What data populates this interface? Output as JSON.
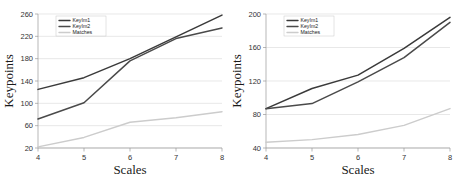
{
  "figure": {
    "panel_count": 2,
    "background": "#ffffff"
  },
  "colors": {
    "keyim1": "#3a3a3a",
    "keyim2": "#4a4a4a",
    "matches": "#cccccc",
    "grid": "#d9d9d9",
    "axis": "#9a9a9a",
    "text": "#1a1a1a"
  },
  "chart_data": [
    {
      "type": "line",
      "panel": "left",
      "title": "",
      "xlabel": "Scales",
      "ylabel": "Keypoints",
      "x": [
        4,
        5,
        6,
        7,
        8
      ],
      "xticklabels": [
        "4",
        "5",
        "6",
        "7",
        "8"
      ],
      "xlim": [
        4,
        8
      ],
      "ylim": [
        20,
        260
      ],
      "yticks": [
        20,
        60,
        100,
        140,
        180,
        220,
        260
      ],
      "yticklabels": [
        "20",
        "60",
        "100",
        "140",
        "180",
        "220",
        "260"
      ],
      "grid": true,
      "legend_position": "upper left",
      "series": [
        {
          "name": "KeyIm1",
          "values": [
            125,
            146,
            180,
            219,
            258
          ],
          "color": "#3a3a3a"
        },
        {
          "name": "KeyIm2",
          "values": [
            72,
            101,
            176,
            216,
            235
          ],
          "color": "#4a4a4a"
        },
        {
          "name": "Matches",
          "values": [
            22,
            39,
            66,
            74,
            85
          ],
          "color": "#cccccc"
        }
      ]
    },
    {
      "type": "line",
      "panel": "right",
      "title": "",
      "xlabel": "Scales",
      "ylabel": "Keypoints",
      "x": [
        4,
        5,
        6,
        7,
        8
      ],
      "xticklabels": [
        "4",
        "5",
        "6",
        "7",
        "8"
      ],
      "xlim": [
        4,
        8
      ],
      "ylim": [
        40,
        200
      ],
      "yticks": [
        40,
        80,
        120,
        160,
        200
      ],
      "yticklabels": [
        "40",
        "80",
        "120",
        "160",
        "200"
      ],
      "grid": true,
      "legend_position": "upper left",
      "series": [
        {
          "name": "KeyIm1",
          "values": [
            87,
            111,
            127,
            159,
            196
          ],
          "color": "#3a3a3a"
        },
        {
          "name": "KeyIm2",
          "values": [
            87,
            93,
            119,
            148,
            190
          ],
          "color": "#4a4a4a"
        },
        {
          "name": "Matches",
          "values": [
            47,
            50,
            56,
            67,
            87
          ],
          "color": "#cccccc"
        }
      ]
    }
  ]
}
